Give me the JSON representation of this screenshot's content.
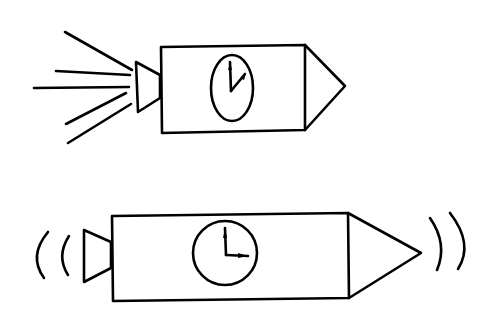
{
  "canvas": {
    "width": 496,
    "height": 313,
    "background": "#ffffff",
    "stroke": "#000000"
  },
  "figures": [
    {
      "id": "top",
      "description": "Capsule with oval clock face (hands near 1 o'clock) and rear nozzle emitting exhaust lines",
      "clock_shape": "ellipse",
      "clock_time_approx": "12:05",
      "effect": "exhaust-lines"
    },
    {
      "id": "bottom",
      "description": "Longer capsule with round clock face (hands at 3 o'clock) and sound-wave arcs on both ends",
      "clock_shape": "circle",
      "clock_time_approx": "3:00",
      "effect": "sound-wave-arcs"
    }
  ]
}
